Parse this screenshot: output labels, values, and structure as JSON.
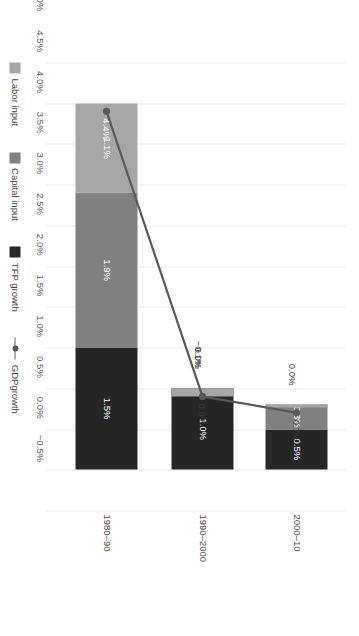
{
  "chart_data": {
    "type": "bar",
    "subtype": "stacked-bar-with-line-overlay",
    "orientation": "rotated-90ccw",
    "title": "",
    "subtitle": "",
    "xlabel": "",
    "ylabel": "",
    "categories": [
      "1980–90",
      "1990–2000",
      "2000–10"
    ],
    "series": [
      {
        "name": "TFP growth",
        "type": "bar",
        "color": "#262626",
        "values": [
          1.5,
          1.0,
          0.5
        ],
        "labels": [
          "1.5%",
          "1.0%",
          "0.5%"
        ]
      },
      {
        "name": "Capital input",
        "type": "bar",
        "color": "#808080",
        "values": [
          1.9,
          0.0,
          0.3
        ],
        "labels": [
          "1.9%",
          "0.0%",
          "0.3%"
        ]
      },
      {
        "name": "Labor input",
        "type": "bar",
        "color": "#a6a6a6",
        "values": [
          1.1,
          -0.1,
          0.0
        ],
        "labels": [
          "1.1%",
          "−0.1%",
          "0.0%"
        ]
      },
      {
        "name": "GDPgrowth",
        "type": "line",
        "color": "#595959",
        "values": [
          4.4,
          0.9,
          0.7
        ],
        "labels": [
          "4.4%",
          "0.9%",
          "0.7%"
        ]
      }
    ],
    "axis": {
      "ticks": [
        5.0,
        4.5,
        4.0,
        3.5,
        3.0,
        2.5,
        2.0,
        1.5,
        1.0,
        0.5,
        0.0,
        -0.5
      ],
      "tick_labels": [
        "5.0%",
        "4.5%",
        "4.0%",
        "3.5%",
        "3.0%",
        "2.5%",
        "2.0%",
        "1.5%",
        "1.0%",
        "0.5%",
        "0.0%",
        "−0.5%"
      ],
      "min": -0.5,
      "max": 5.0,
      "step": 0.5,
      "grid": true
    },
    "legend": {
      "position": "bottom",
      "entries": [
        {
          "label": "Labor input",
          "marker": "square",
          "color": "#a6a6a6"
        },
        {
          "label": "Capital input",
          "marker": "square",
          "color": "#808080"
        },
        {
          "label": "TFP growth",
          "marker": "square",
          "color": "#262626"
        },
        {
          "label": "GDPgrowth",
          "marker": "line-dot",
          "color": "#595959"
        }
      ]
    }
  },
  "colors": {
    "background": "#ffffff",
    "gridline": "#e9e9e9",
    "tick_text": "#5a5a5a",
    "label_text": "#3f3f3f",
    "bar_label_light": "#ffffff",
    "bar_label_dark": "#3a3a3a",
    "labor_input": "#a6a6a6",
    "capital_input": "#808080",
    "tfp_growth": "#262626",
    "gdp_growth": "#595959"
  }
}
